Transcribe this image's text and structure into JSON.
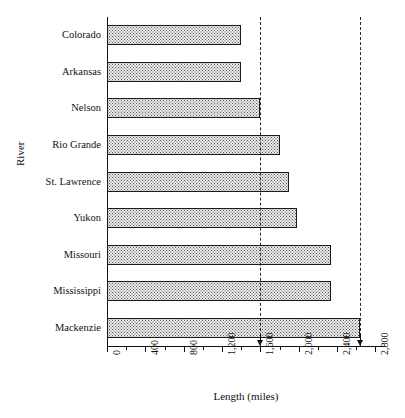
{
  "chart_data": {
    "type": "bar",
    "orientation": "horizontal",
    "title": "",
    "xlabel": "Length (miles)",
    "ylabel": "River",
    "categories": [
      "Colorado",
      "Arkansas",
      "Nelson",
      "Rio Grande",
      "St. Lawrence",
      "Yukon",
      "Missouri",
      "Mississippi",
      "Mackenzie"
    ],
    "values": [
      1400,
      1400,
      1600,
      1800,
      1900,
      1980,
      2340,
      2340,
      2635
    ],
    "xlim": [
      0,
      2900
    ],
    "ylim": [
      0,
      9
    ],
    "xticks": [
      0,
      400,
      800,
      1200,
      1600,
      2000,
      2400,
      2800
    ],
    "xticklabels": [
      "0",
      "400",
      "800",
      "1,200",
      "1,600",
      "2,000",
      "2,400",
      "2,800"
    ],
    "xtick_minor_step": 200,
    "grid": false,
    "legend": null,
    "bar_fill": "cross-hatch-dot-pattern",
    "bar_edge_color": "#1a1a1a",
    "bar_face_color": "#ebebeb",
    "reference_lines": [
      {
        "name": "lower-reference",
        "value": 1600,
        "style": "dashed",
        "marker": "down-arrow"
      },
      {
        "name": "upper-reference",
        "value": 2635,
        "style": "dashed",
        "marker": "down-arrow"
      }
    ]
  }
}
